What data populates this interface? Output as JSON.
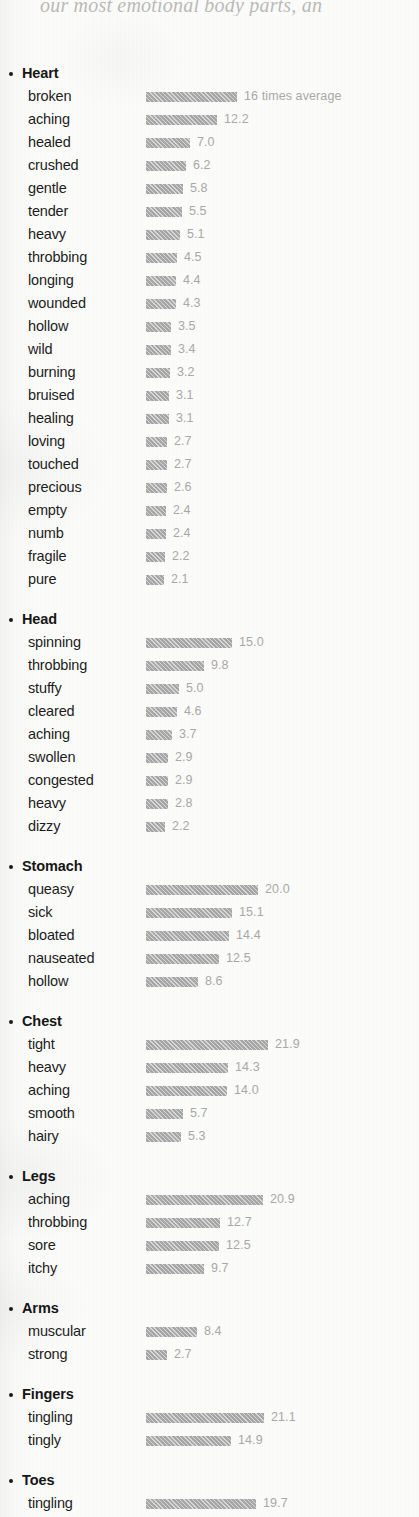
{
  "page": {
    "top_partial_text": "our most emotional body parts, an",
    "bar_unit_note": "16 times average"
  },
  "chart_data": {
    "type": "bar",
    "title": "",
    "xlabel": "",
    "ylabel": "",
    "value_unit": "times average",
    "first_bar_annotation": "16 times average",
    "orientation": "horizontal",
    "grid": false,
    "legend": "none",
    "axis_range": [
      0,
      21.9
    ],
    "colors": {
      "bar_fill": "#a6a6a6",
      "value_text": "#a8a8a6",
      "label_text": "#1d1d1d",
      "heading_text": "#161616",
      "page_background": "#fbfbfa"
    },
    "groups": [
      {
        "name": "Heart",
        "items": [
          {
            "label": "broken",
            "value": 16.0,
            "display": "16 times average"
          },
          {
            "label": "aching",
            "value": 12.2,
            "display": "12.2"
          },
          {
            "label": "healed",
            "value": 7.0,
            "display": "7.0"
          },
          {
            "label": "crushed",
            "value": 6.2,
            "display": "6.2"
          },
          {
            "label": "gentle",
            "value": 5.8,
            "display": "5.8"
          },
          {
            "label": "tender",
            "value": 5.5,
            "display": "5.5"
          },
          {
            "label": "heavy",
            "value": 5.1,
            "display": "5.1"
          },
          {
            "label": "throbbing",
            "value": 4.5,
            "display": "4.5"
          },
          {
            "label": "longing",
            "value": 4.4,
            "display": "4.4"
          },
          {
            "label": "wounded",
            "value": 4.3,
            "display": "4.3"
          },
          {
            "label": "hollow",
            "value": 3.5,
            "display": "3.5"
          },
          {
            "label": "wild",
            "value": 3.4,
            "display": "3.4"
          },
          {
            "label": "burning",
            "value": 3.2,
            "display": "3.2"
          },
          {
            "label": "bruised",
            "value": 3.1,
            "display": "3.1"
          },
          {
            "label": "healing",
            "value": 3.1,
            "display": "3.1"
          },
          {
            "label": "loving",
            "value": 2.7,
            "display": "2.7"
          },
          {
            "label": "touched",
            "value": 2.7,
            "display": "2.7"
          },
          {
            "label": "precious",
            "value": 2.6,
            "display": "2.6"
          },
          {
            "label": "empty",
            "value": 2.4,
            "display": "2.4"
          },
          {
            "label": "numb",
            "value": 2.4,
            "display": "2.4"
          },
          {
            "label": "fragile",
            "value": 2.2,
            "display": "2.2"
          },
          {
            "label": "pure",
            "value": 2.1,
            "display": "2.1"
          }
        ]
      },
      {
        "name": "Head",
        "items": [
          {
            "label": "spinning",
            "value": 15.0,
            "display": "15.0"
          },
          {
            "label": "throbbing",
            "value": 9.8,
            "display": "9.8"
          },
          {
            "label": "stuffy",
            "value": 5.0,
            "display": "5.0"
          },
          {
            "label": "cleared",
            "value": 4.6,
            "display": "4.6"
          },
          {
            "label": "aching",
            "value": 3.7,
            "display": "3.7"
          },
          {
            "label": "swollen",
            "value": 2.9,
            "display": "2.9"
          },
          {
            "label": "congested",
            "value": 2.9,
            "display": "2.9"
          },
          {
            "label": "heavy",
            "value": 2.8,
            "display": "2.8"
          },
          {
            "label": "dizzy",
            "value": 2.2,
            "display": "2.2"
          }
        ]
      },
      {
        "name": "Stomach",
        "items": [
          {
            "label": "queasy",
            "value": 20.0,
            "display": "20.0"
          },
          {
            "label": "sick",
            "value": 15.1,
            "display": "15.1"
          },
          {
            "label": "bloated",
            "value": 14.4,
            "display": "14.4"
          },
          {
            "label": "nauseated",
            "value": 12.5,
            "display": "12.5"
          },
          {
            "label": "hollow",
            "value": 8.6,
            "display": "8.6"
          }
        ]
      },
      {
        "name": "Chest",
        "items": [
          {
            "label": "tight",
            "value": 21.9,
            "display": "21.9"
          },
          {
            "label": "heavy",
            "value": 14.3,
            "display": "14.3"
          },
          {
            "label": "aching",
            "value": 14.0,
            "display": "14.0"
          },
          {
            "label": "smooth",
            "value": 5.7,
            "display": "5.7"
          },
          {
            "label": "hairy",
            "value": 5.3,
            "display": "5.3"
          }
        ]
      },
      {
        "name": "Legs",
        "items": [
          {
            "label": "aching",
            "value": 20.9,
            "display": "20.9"
          },
          {
            "label": "throbbing",
            "value": 12.7,
            "display": "12.7"
          },
          {
            "label": "sore",
            "value": 12.5,
            "display": "12.5"
          },
          {
            "label": "itchy",
            "value": 9.7,
            "display": "9.7"
          }
        ]
      },
      {
        "name": "Arms",
        "items": [
          {
            "label": "muscular",
            "value": 8.4,
            "display": "8.4"
          },
          {
            "label": "strong",
            "value": 2.7,
            "display": "2.7"
          }
        ]
      },
      {
        "name": "Fingers",
        "items": [
          {
            "label": "tingling",
            "value": 21.1,
            "display": "21.1"
          },
          {
            "label": "tingly",
            "value": 14.9,
            "display": "14.9"
          }
        ]
      },
      {
        "name": "Toes",
        "items": [
          {
            "label": "tingling",
            "value": 19.7,
            "display": "19.7"
          }
        ]
      }
    ]
  }
}
